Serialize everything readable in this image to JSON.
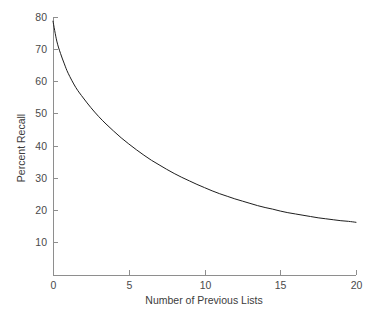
{
  "chart_data": {
    "type": "line",
    "title": "",
    "subtitle": "",
    "xlabel": "Number of Previous Lists",
    "ylabel": "Percent Recall",
    "xlim": [
      0,
      20
    ],
    "ylim": [
      0,
      80
    ],
    "xticks": [
      0,
      5,
      10,
      15,
      20
    ],
    "xtick_labels": [
      "0",
      "5",
      "10",
      "15",
      "20"
    ],
    "yticks": [
      10,
      20,
      30,
      40,
      50,
      60,
      70,
      80
    ],
    "ytick_labels": [
      "10",
      "20",
      "30",
      "40",
      "50",
      "60",
      "70",
      "80"
    ],
    "grid": false,
    "legend": null,
    "annotations": [],
    "series": [
      {
        "name": "Percent Recall",
        "color": "#1e1e1e",
        "x": [
          0,
          0.25,
          0.5,
          0.75,
          1,
          1.5,
          2,
          2.5,
          3,
          3.5,
          4,
          4.5,
          5,
          5.5,
          6,
          6.5,
          7,
          7.5,
          8,
          8.5,
          9,
          9.5,
          10,
          10.5,
          11,
          11.5,
          12,
          12.5,
          13,
          13.5,
          14,
          14.5,
          15,
          15.5,
          16,
          16.5,
          17,
          17.5,
          18,
          18.5,
          19,
          19.5,
          20
        ],
        "y": [
          78.7,
          72.5,
          68.6,
          65.4,
          62.5,
          58.1,
          54.8,
          51.8,
          49.1,
          46.7,
          44.5,
          42.4,
          40.5,
          38.7,
          37.0,
          35.4,
          34.0,
          32.6,
          31.3,
          30.1,
          29.0,
          27.9,
          26.9,
          25.9,
          25.0,
          24.2,
          23.4,
          22.7,
          22.0,
          21.3,
          20.7,
          20.2,
          19.6,
          19.1,
          18.7,
          18.3,
          17.9,
          17.5,
          17.2,
          16.9,
          16.6,
          16.4,
          16.1
        ]
      }
    ],
    "asymptote": 16
  },
  "geometry": {
    "plot_left": 53,
    "plot_right": 356,
    "plot_top": 17,
    "plot_bottom": 275,
    "y_at_top": 80,
    "y_at_bottom": -0.3
  }
}
